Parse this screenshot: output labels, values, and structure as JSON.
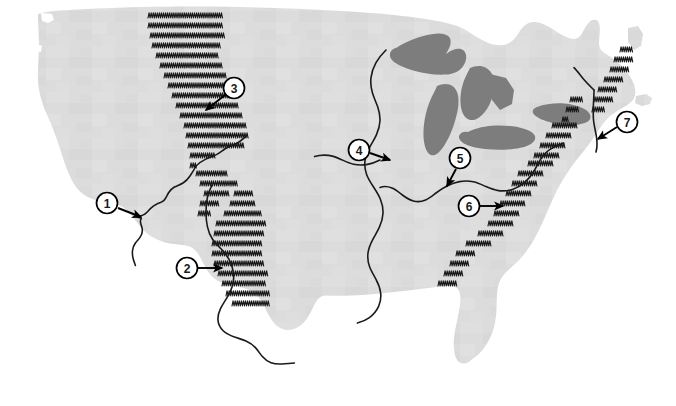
{
  "map": {
    "title": "Physical Features of the Contiguous United States",
    "region": "United States",
    "projection_note": "outline map, no labels",
    "background_color": "#ffffff",
    "land_fill_color": "#dcdcdc",
    "land_texture": "paper grain",
    "lake_fill_color": "#7d7d7d",
    "river_line_color": "#1a1a1a",
    "mountain_symbol_color": "#1a1a1a",
    "mountain_symbol": "caret-chevron",
    "marker_fill_color": "#ffffff",
    "marker_stroke_color": "#000000",
    "arrow_color": "#000000"
  },
  "markers": [
    {
      "id": "1",
      "label": "1",
      "cx": 107,
      "cy": 203,
      "points_to": "Colorado River",
      "arrow_from_x": 118,
      "arrow_from_y": 208,
      "arrow_to_x": 141,
      "arrow_to_y": 217
    },
    {
      "id": "2",
      "label": "2",
      "cx": 187,
      "cy": 268,
      "points_to": "Sierra Madre / southern Rocky Mountains",
      "arrow_from_x": 198,
      "arrow_from_y": 268,
      "arrow_to_x": 222,
      "arrow_to_y": 268
    },
    {
      "id": "3",
      "label": "3",
      "cx": 234,
      "cy": 88,
      "points_to": "Rocky Mountains",
      "arrow_from_x": 225,
      "arrow_from_y": 95,
      "arrow_to_x": 206,
      "arrow_to_y": 110
    },
    {
      "id": "4",
      "label": "4",
      "cx": 359,
      "cy": 150,
      "points_to": "Mississippi River",
      "arrow_from_x": 370,
      "arrow_from_y": 153,
      "arrow_to_x": 390,
      "arrow_to_y": 160
    },
    {
      "id": "5",
      "label": "5",
      "cx": 460,
      "cy": 158,
      "points_to": "Ohio River",
      "arrow_from_x": 456,
      "arrow_from_y": 169,
      "arrow_to_x": 447,
      "arrow_to_y": 186
    },
    {
      "id": "6",
      "label": "6",
      "cx": 469,
      "cy": 206,
      "points_to": "Appalachian Mountains",
      "arrow_from_x": 480,
      "arrow_from_y": 206,
      "arrow_to_x": 503,
      "arrow_to_y": 206
    },
    {
      "id": "7",
      "label": "7",
      "cx": 627,
      "cy": 122,
      "points_to": "Hudson River",
      "arrow_from_x": 617,
      "arrow_from_y": 127,
      "arrow_to_x": 598,
      "arrow_to_y": 139
    }
  ],
  "mountain_ranges": [
    {
      "name": "cascades-northern-rockies",
      "rows": [
        {
          "y": 18,
          "x_start": 148,
          "count": 12
        },
        {
          "y": 28,
          "x_start": 148,
          "count": 12
        },
        {
          "y": 38,
          "x_start": 150,
          "count": 12
        },
        {
          "y": 48,
          "x_start": 152,
          "count": 11
        },
        {
          "y": 58,
          "x_start": 156,
          "count": 10
        },
        {
          "y": 68,
          "x_start": 160,
          "count": 10
        },
        {
          "y": 78,
          "x_start": 164,
          "count": 10
        },
        {
          "y": 88,
          "x_start": 168,
          "count": 10
        },
        {
          "y": 98,
          "x_start": 172,
          "count": 10
        },
        {
          "y": 108,
          "x_start": 176,
          "count": 10
        },
        {
          "y": 118,
          "x_start": 180,
          "count": 10
        },
        {
          "y": 128,
          "x_start": 184,
          "count": 10
        },
        {
          "y": 138,
          "x_start": 186,
          "count": 10
        },
        {
          "y": 148,
          "x_start": 188,
          "count": 9
        },
        {
          "y": 158,
          "x_start": 190,
          "count": 4
        }
      ]
    },
    {
      "name": "southern-rockies-sierra-madre",
      "rows": [
        {
          "y": 168,
          "x_start": 190,
          "count": 1
        },
        {
          "y": 176,
          "x_start": 196,
          "count": 5
        },
        {
          "y": 186,
          "x_start": 200,
          "count": 6
        },
        {
          "y": 196,
          "x_start": 204,
          "count": 4
        },
        {
          "y": 196,
          "x_start": 234,
          "count": 3
        },
        {
          "y": 206,
          "x_start": 200,
          "count": 3
        },
        {
          "y": 206,
          "x_start": 230,
          "count": 4
        },
        {
          "y": 216,
          "x_start": 198,
          "count": 2
        },
        {
          "y": 216,
          "x_start": 224,
          "count": 6
        },
        {
          "y": 226,
          "x_start": 216,
          "count": 8
        },
        {
          "y": 236,
          "x_start": 214,
          "count": 8
        },
        {
          "y": 246,
          "x_start": 212,
          "count": 8
        },
        {
          "y": 256,
          "x_start": 212,
          "count": 8
        },
        {
          "y": 266,
          "x_start": 214,
          "count": 8
        },
        {
          "y": 276,
          "x_start": 218,
          "count": 8
        },
        {
          "y": 286,
          "x_start": 222,
          "count": 7
        },
        {
          "y": 296,
          "x_start": 226,
          "count": 7
        },
        {
          "y": 306,
          "x_start": 232,
          "count": 6
        }
      ]
    },
    {
      "name": "appalachians",
      "rows": [
        {
          "y": 176,
          "x_start": 518,
          "count": 4
        },
        {
          "y": 186,
          "x_start": 512,
          "count": 4
        },
        {
          "y": 196,
          "x_start": 506,
          "count": 4
        },
        {
          "y": 206,
          "x_start": 500,
          "count": 4
        },
        {
          "y": 216,
          "x_start": 494,
          "count": 4
        },
        {
          "y": 226,
          "x_start": 488,
          "count": 4
        },
        {
          "y": 236,
          "x_start": 478,
          "count": 4
        },
        {
          "y": 246,
          "x_start": 466,
          "count": 4
        },
        {
          "y": 256,
          "x_start": 456,
          "count": 3
        },
        {
          "y": 266,
          "x_start": 450,
          "count": 3
        },
        {
          "y": 276,
          "x_start": 444,
          "count": 3
        },
        {
          "y": 286,
          "x_start": 438,
          "count": 3
        }
      ]
    },
    {
      "name": "northern-appalachians-adirondacks",
      "rows": [
        {
          "y": 52,
          "x_start": 620,
          "count": 2
        },
        {
          "y": 62,
          "x_start": 614,
          "count": 3
        },
        {
          "y": 72,
          "x_start": 610,
          "count": 3
        },
        {
          "y": 82,
          "x_start": 604,
          "count": 3
        },
        {
          "y": 92,
          "x_start": 598,
          "count": 3
        },
        {
          "y": 102,
          "x_start": 594,
          "count": 3
        },
        {
          "y": 112,
          "x_start": 592,
          "count": 2
        },
        {
          "y": 102,
          "x_start": 570,
          "count": 2
        },
        {
          "y": 112,
          "x_start": 566,
          "count": 2
        },
        {
          "y": 122,
          "x_start": 562,
          "count": 1
        },
        {
          "y": 128,
          "x_start": 552,
          "count": 4
        },
        {
          "y": 138,
          "x_start": 546,
          "count": 4
        },
        {
          "y": 148,
          "x_start": 540,
          "count": 4
        },
        {
          "y": 158,
          "x_start": 534,
          "count": 4
        },
        {
          "y": 166,
          "x_start": 528,
          "count": 4
        }
      ]
    }
  ],
  "rivers": [
    {
      "name": "Colorado River"
    },
    {
      "name": "Rio Grande"
    },
    {
      "name": "Mississippi River"
    },
    {
      "name": "Ohio River"
    },
    {
      "name": "Missouri River"
    },
    {
      "name": "Hudson River"
    }
  ],
  "lakes": [
    {
      "name": "Lake Superior"
    },
    {
      "name": "Lake Michigan"
    },
    {
      "name": "Lake Huron"
    },
    {
      "name": "Lake Erie"
    },
    {
      "name": "Lake Ontario"
    }
  ]
}
